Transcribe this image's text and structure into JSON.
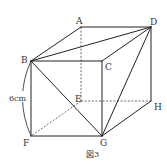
{
  "figure": {
    "caption": "図3",
    "dimension_label": "6cm",
    "colors": {
      "line": "#222222",
      "text": "#333333",
      "background": "#ffffff"
    },
    "vertices": {
      "A": {
        "label": "A",
        "x": 81,
        "y": 27
      },
      "D": {
        "label": "D",
        "x": 151,
        "y": 27
      },
      "B": {
        "label": "B",
        "x": 31,
        "y": 61
      },
      "C": {
        "label": "C",
        "x": 102,
        "y": 61
      },
      "E": {
        "label": "E",
        "x": 81,
        "y": 101
      },
      "H": {
        "label": "H",
        "x": 151,
        "y": 101
      },
      "F": {
        "label": "F",
        "x": 31,
        "y": 136
      },
      "G": {
        "label": "G",
        "x": 102,
        "y": 136
      }
    },
    "solid_edges": [
      "AD",
      "AB",
      "BC",
      "CD",
      "DH",
      "BF",
      "FG",
      "CG",
      "GH",
      "BD",
      "BG",
      "DG"
    ],
    "dashed_edges": [
      "AE",
      "EH",
      "EF"
    ]
  }
}
